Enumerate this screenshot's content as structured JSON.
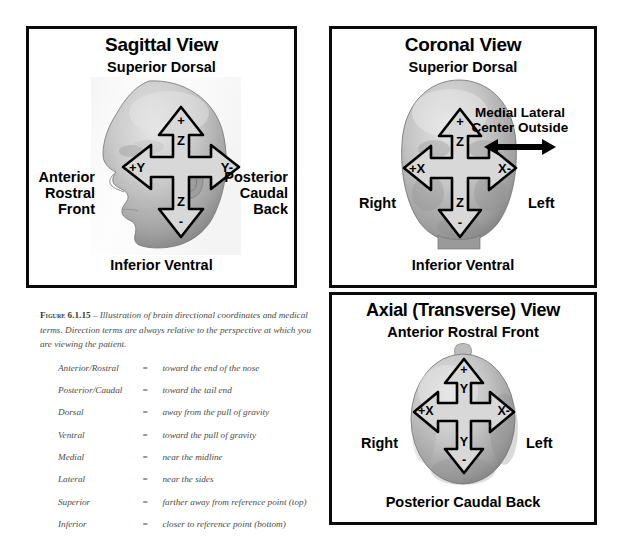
{
  "figure": {
    "label_prefix": "Figure",
    "number": "6.1.15",
    "dash": "–",
    "caption": "Illustration of brain directional coordinates and medical terms. Direction terms are always relative to the perspective at which you are viewing the patient.",
    "equals": "="
  },
  "panels": {
    "sagittal": {
      "title": "Sagittal View",
      "top_label": "Superior Dorsal",
      "bottom_label": "Inferior Ventral",
      "left_label": [
        "Anterior",
        "Rostral",
        "Front"
      ],
      "right_label": [
        "Posterior",
        "Caudal",
        "Back"
      ],
      "axes": {
        "up_sign": "+",
        "up_axis": "Z",
        "down_axis": "Z",
        "down_sign": "-",
        "left_axis": "+Y",
        "right_axis": "Y-"
      }
    },
    "coronal": {
      "title": "Coronal View",
      "top_label": "Superior Dorsal",
      "bottom_label": "Inferior Ventral",
      "left_label": [
        "Right"
      ],
      "right_label": [
        "Left"
      ],
      "medial_lateral": [
        "Medial  Lateral",
        "Center Outside"
      ],
      "axes": {
        "up_sign": "+",
        "up_axis": "Z",
        "down_axis": "Z",
        "down_sign": "-",
        "left_axis": "+X",
        "right_axis": "X-"
      }
    },
    "axial": {
      "title": "Axial (Transverse) View",
      "top_label": "Anterior Rostral Front",
      "bottom_label": "Posterior Caudal Back",
      "left_label": [
        "Right"
      ],
      "right_label": [
        "Left"
      ],
      "axes": {
        "up_sign": "+",
        "up_axis": "Y",
        "down_axis": "Y",
        "down_sign": "-",
        "left_axis": "+X",
        "right_axis": "X-"
      }
    }
  },
  "glossary": {
    "rows": [
      {
        "term": "Anterior/Rostral",
        "definition": "toward the end of the nose"
      },
      {
        "term": "Posterior/Caudal",
        "definition": "toward the tail end"
      },
      {
        "term": "Dorsal",
        "definition": "away from the pull of gravity"
      },
      {
        "term": "Ventral",
        "definition": "toward the pull of gravity"
      },
      {
        "term": "Medial",
        "definition": "near the midline"
      },
      {
        "term": "Lateral",
        "definition": "near the sides"
      },
      {
        "term": "Superior",
        "definition": "farther away from reference point (top)"
      },
      {
        "term": "Inferior",
        "definition": "closer to reference point (bottom)"
      }
    ]
  },
  "colors": {
    "border": "#0a0a0a",
    "text": "#000000",
    "caption_text": "#4a4a4a",
    "arrow_fill": "#d8d8d8",
    "arrow_stroke": "#000000",
    "head_light": "#d9d9d9",
    "head_mid": "#a8a8a8",
    "head_dark": "#6d6d6d",
    "background": "#ffffff"
  }
}
